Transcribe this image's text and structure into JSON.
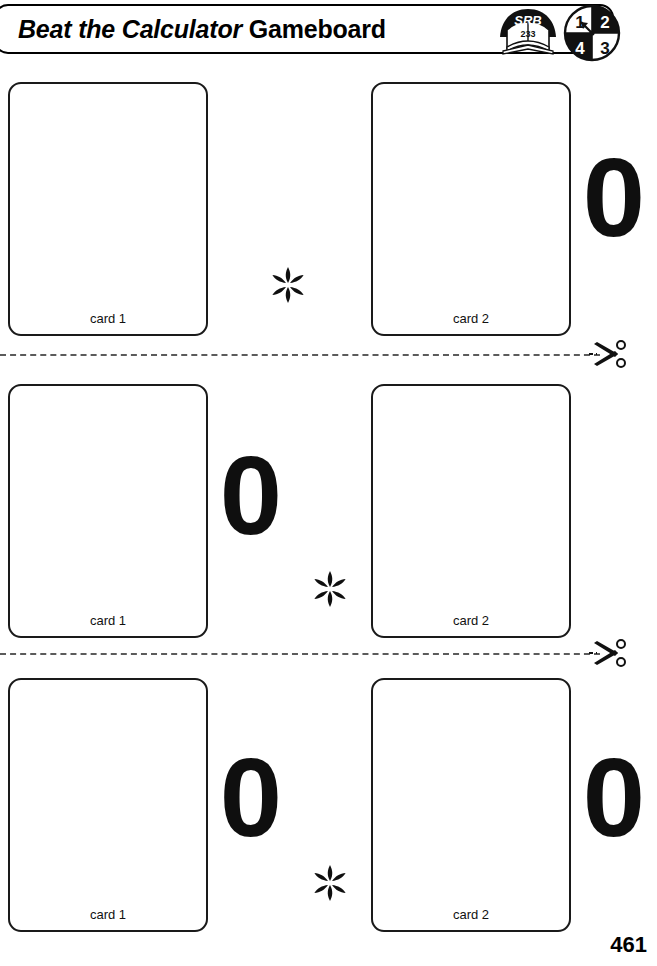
{
  "header": {
    "title_italic": "Beat the Calculator",
    "title_roman": "Gameboard",
    "srb_icon": {
      "name": "srb-book-icon",
      "label": "SRB",
      "page": "233"
    },
    "spinner_icon": {
      "name": "spinner-icon",
      "quadrants": [
        "1",
        "2",
        "3",
        "4"
      ]
    }
  },
  "rows": [
    {
      "id": "row-1",
      "card1_label": "card 1",
      "card2_label": "card 2",
      "operator": "*",
      "zero_middle": null,
      "zero_right": "0"
    },
    {
      "id": "row-2",
      "card1_label": "card 1",
      "card2_label": "card 2",
      "operator": "*",
      "zero_middle": "0",
      "zero_right": null
    },
    {
      "id": "row-3",
      "card1_label": "card 1",
      "card2_label": "card 2",
      "operator": "*",
      "zero_middle": "0",
      "zero_right": "0"
    }
  ],
  "cut_lines": [
    {
      "id": "cut-line-1",
      "scissors_icon": "scissors-icon"
    },
    {
      "id": "cut-line-2",
      "scissors_icon": "scissors-icon"
    }
  ],
  "footer": {
    "page_number": "461"
  },
  "colors": {
    "ink": "#000000",
    "card_border": "#1a1a1a",
    "cut_line": "#5b5b5b",
    "background": "#ffffff"
  }
}
